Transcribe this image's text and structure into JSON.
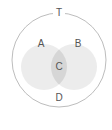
{
  "diagram": {
    "type": "venn",
    "universe": {
      "label": "T",
      "cx": 59,
      "cy": 60,
      "r": 47,
      "stroke": "#bdbdbd"
    },
    "sets": [
      {
        "label": "A",
        "cx": 44,
        "cy": 67,
        "r": 23,
        "fill": "#ececec",
        "label_x": 41,
        "label_y": 47
      },
      {
        "label": "B",
        "cx": 74,
        "cy": 67,
        "r": 23,
        "fill": "#ececec",
        "label_x": 78,
        "label_y": 47
      }
    ],
    "intersection": {
      "label": "C",
      "fill": "#d6d6d6",
      "label_x": 59,
      "label_y": 70
    },
    "outside": {
      "label": "D",
      "label_x": 59,
      "label_y": 101
    },
    "colors": {
      "set_fill": "#ececec",
      "intersection_fill": "#d6d6d6",
      "outline": "#bdbdbd",
      "text": "#555555"
    }
  }
}
